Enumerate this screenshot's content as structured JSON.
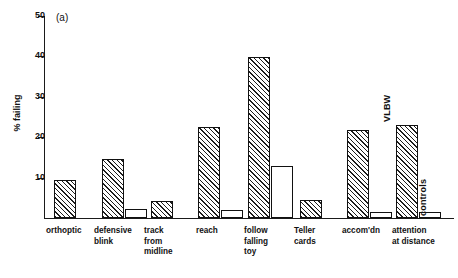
{
  "chart_data": {
    "type": "bar",
    "title": "",
    "panel_label": "(a)",
    "xlabel": "",
    "ylabel": "% failing",
    "ylim": [
      0,
      50
    ],
    "yticks": [
      10,
      20,
      30,
      40,
      50
    ],
    "ytick_labels": [
      "10",
      "20",
      "30",
      "40",
      "50"
    ],
    "grid": false,
    "legend_position": "in-plot-rotated",
    "categories": [
      "orthoptic",
      "defensive\nblink",
      "track\nfrom\nmidline",
      "reach",
      "follow\nfalling\ntoy",
      "Teller\ncards",
      "accom'dn",
      "attention\nat distance"
    ],
    "series": [
      {
        "name": "VLBW",
        "fill": "hatched",
        "color": "#1d1d1d",
        "values": [
          9.5,
          14.7,
          4.3,
          22.5,
          39.8,
          4.5,
          21.7,
          23.0
        ]
      },
      {
        "name": "controls",
        "fill": "open",
        "color": "#ffffff",
        "values": [
          null,
          2.3,
          null,
          2.0,
          12.8,
          null,
          1.6,
          1.5
        ]
      }
    ]
  },
  "axis": {
    "y_title": "% failing"
  }
}
